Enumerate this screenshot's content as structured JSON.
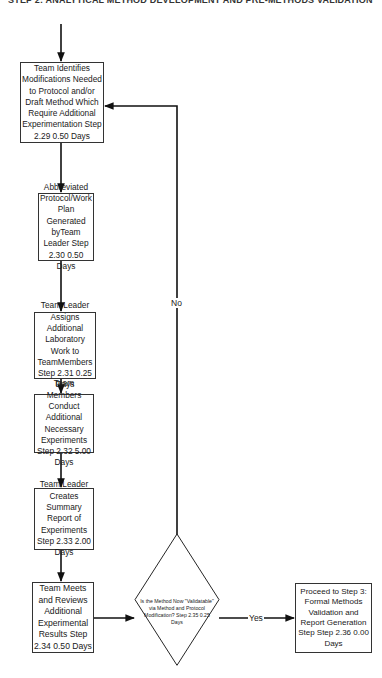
{
  "header": {
    "title": "STEP 2: ANALYTICAL METHOD DEVELOPMENT AND PRE-METHODS VALIDATION"
  },
  "nodes": [
    {
      "id": "step-2-29",
      "type": "process",
      "text": "Team Identifies Modifications Needed to Protocol and/or Draft Method Which Require Additional Experimentation Step 2.29  0.50 Days"
    },
    {
      "id": "step-2-30",
      "type": "process",
      "text": "Abbreviated Protocol/Work Plan Generated byTeam Leader Step 2.30  0.50 Days"
    },
    {
      "id": "step-2-31",
      "type": "process",
      "text": "Team Leader Assigns Additional Laboratory Work to TeamMembers Step 2.31  0.25 Days"
    },
    {
      "id": "step-2-32",
      "type": "process",
      "text": "Team Members Conduct Additional Necessary Experiments Step 2.32  5.00 Days"
    },
    {
      "id": "step-2-33",
      "type": "process",
      "text": "Team Leader Creates Summary Report of Experiments Step 2.33  2.00 Days"
    },
    {
      "id": "step-2-34",
      "type": "process",
      "text": "Team Meets and Reviews Additional Experimental Results Step 2.34  0.50 Days"
    },
    {
      "id": "step-2-35",
      "type": "decision",
      "text": "Is the Method Now \"Validatable\" via Method and Protocol Modification? Step 2.35  0.25 Days"
    },
    {
      "id": "step-2-36",
      "type": "process",
      "text": "Proceed to Step 3: Formal Methods Validation and Report Generation Step Step 2.36  0.00 Days"
    }
  ],
  "edges": {
    "no_label": "No",
    "yes_label": "Yes"
  }
}
